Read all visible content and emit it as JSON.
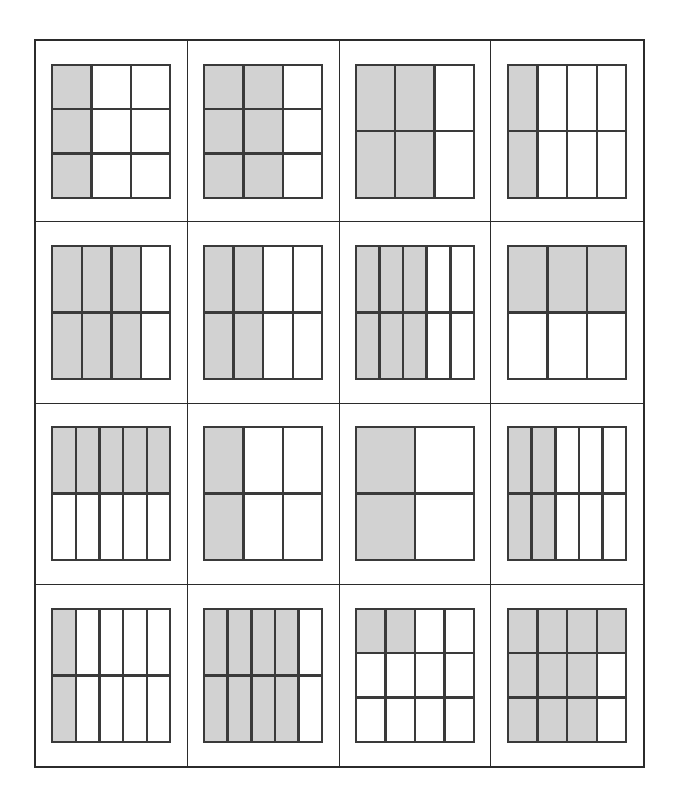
{
  "worksheet": {
    "layout": {
      "panel_rows": 4,
      "panel_cols": 4,
      "panel_count": 16
    },
    "colors": {
      "shaded": "#d2d2d2",
      "unshaded": "#ffffff",
      "grid_line": "#3a3a3a",
      "frame_line": "#2b2b2b",
      "background": "#ffffff"
    },
    "panels": [
      {
        "index": 1,
        "name": "fraction-model-1",
        "cols": 3,
        "rows": 3,
        "total_parts": 9,
        "shaded_parts": 3,
        "fraction": "3/9",
        "simplified": "1/3",
        "shading_pattern": "left-columns",
        "shaded_columns": 1,
        "cells": [
          [
            1,
            0,
            0
          ],
          [
            1,
            0,
            0
          ],
          [
            1,
            0,
            0
          ]
        ]
      },
      {
        "index": 2,
        "name": "fraction-model-2",
        "cols": 3,
        "rows": 3,
        "total_parts": 9,
        "shaded_parts": 6,
        "fraction": "6/9",
        "simplified": "2/3",
        "shading_pattern": "left-columns",
        "shaded_columns": 2,
        "cells": [
          [
            1,
            1,
            0
          ],
          [
            1,
            1,
            0
          ],
          [
            1,
            1,
            0
          ]
        ]
      },
      {
        "index": 3,
        "name": "fraction-model-3",
        "cols": 3,
        "rows": 2,
        "total_parts": 6,
        "shaded_parts": 4,
        "fraction": "4/6",
        "simplified": "2/3",
        "shading_pattern": "left-columns",
        "shaded_columns": 2,
        "cells": [
          [
            1,
            1,
            0
          ],
          [
            1,
            1,
            0
          ]
        ]
      },
      {
        "index": 4,
        "name": "fraction-model-4",
        "cols": 4,
        "rows": 2,
        "total_parts": 8,
        "shaded_parts": 2,
        "fraction": "2/8",
        "simplified": "1/4",
        "shading_pattern": "left-columns",
        "shaded_columns": 1,
        "cells": [
          [
            1,
            0,
            0,
            0
          ],
          [
            1,
            0,
            0,
            0
          ]
        ]
      },
      {
        "index": 5,
        "name": "fraction-model-5",
        "cols": 4,
        "rows": 2,
        "total_parts": 8,
        "shaded_parts": 6,
        "fraction": "6/8",
        "simplified": "3/4",
        "shading_pattern": "left-columns",
        "shaded_columns": 3,
        "cells": [
          [
            1,
            1,
            1,
            0
          ],
          [
            1,
            1,
            1,
            0
          ]
        ]
      },
      {
        "index": 6,
        "name": "fraction-model-6",
        "cols": 4,
        "rows": 2,
        "total_parts": 8,
        "shaded_parts": 4,
        "fraction": "4/8",
        "simplified": "1/2",
        "shading_pattern": "left-columns",
        "shaded_columns": 2,
        "cells": [
          [
            1,
            1,
            0,
            0
          ],
          [
            1,
            1,
            0,
            0
          ]
        ]
      },
      {
        "index": 7,
        "name": "fraction-model-7",
        "cols": 5,
        "rows": 2,
        "total_parts": 10,
        "shaded_parts": 6,
        "fraction": "6/10",
        "simplified": "3/5",
        "shading_pattern": "left-columns",
        "shaded_columns": 3,
        "cells": [
          [
            1,
            1,
            1,
            0,
            0
          ],
          [
            1,
            1,
            1,
            0,
            0
          ]
        ]
      },
      {
        "index": 8,
        "name": "fraction-model-8",
        "cols": 3,
        "rows": 2,
        "total_parts": 6,
        "shaded_parts": 3,
        "fraction": "3/6",
        "simplified": "1/2",
        "shading_pattern": "top-rows",
        "shaded_rows": 1,
        "cells": [
          [
            1,
            1,
            1
          ],
          [
            0,
            0,
            0
          ]
        ]
      },
      {
        "index": 9,
        "name": "fraction-model-9",
        "cols": 5,
        "rows": 2,
        "total_parts": 10,
        "shaded_parts": 5,
        "fraction": "5/10",
        "simplified": "1/2",
        "shading_pattern": "top-rows",
        "shaded_rows": 1,
        "cells": [
          [
            1,
            1,
            1,
            1,
            1
          ],
          [
            0,
            0,
            0,
            0,
            0
          ]
        ]
      },
      {
        "index": 10,
        "name": "fraction-model-10",
        "cols": 3,
        "rows": 2,
        "total_parts": 6,
        "shaded_parts": 2,
        "fraction": "2/6",
        "simplified": "1/3",
        "shading_pattern": "left-columns",
        "shaded_columns": 1,
        "cells": [
          [
            1,
            0,
            0
          ],
          [
            1,
            0,
            0
          ]
        ]
      },
      {
        "index": 11,
        "name": "fraction-model-11",
        "cols": 2,
        "rows": 2,
        "total_parts": 4,
        "shaded_parts": 2,
        "fraction": "2/4",
        "simplified": "1/2",
        "shading_pattern": "left-columns",
        "shaded_columns": 1,
        "cells": [
          [
            1,
            0
          ],
          [
            1,
            0
          ]
        ]
      },
      {
        "index": 12,
        "name": "fraction-model-12",
        "cols": 5,
        "rows": 2,
        "total_parts": 10,
        "shaded_parts": 4,
        "fraction": "4/10",
        "simplified": "2/5",
        "shading_pattern": "left-columns",
        "shaded_columns": 2,
        "cells": [
          [
            1,
            1,
            0,
            0,
            0
          ],
          [
            1,
            1,
            0,
            0,
            0
          ]
        ]
      },
      {
        "index": 13,
        "name": "fraction-model-13",
        "cols": 5,
        "rows": 2,
        "total_parts": 10,
        "shaded_parts": 2,
        "fraction": "2/10",
        "simplified": "1/5",
        "shading_pattern": "left-columns",
        "shaded_columns": 1,
        "cells": [
          [
            1,
            0,
            0,
            0,
            0
          ],
          [
            1,
            0,
            0,
            0,
            0
          ]
        ]
      },
      {
        "index": 14,
        "name": "fraction-model-14",
        "cols": 5,
        "rows": 2,
        "total_parts": 10,
        "shaded_parts": 8,
        "fraction": "8/10",
        "simplified": "4/5",
        "shading_pattern": "left-columns",
        "shaded_columns": 4,
        "cells": [
          [
            1,
            1,
            1,
            1,
            0
          ],
          [
            1,
            1,
            1,
            1,
            0
          ]
        ]
      },
      {
        "index": 15,
        "name": "fraction-model-15",
        "cols": 4,
        "rows": 3,
        "total_parts": 12,
        "shaded_parts": 2,
        "fraction": "2/12",
        "simplified": "1/6",
        "shading_pattern": "partial-top-left",
        "cells": [
          [
            1,
            1,
            0,
            0
          ],
          [
            0,
            0,
            0,
            0
          ],
          [
            0,
            0,
            0,
            0
          ]
        ]
      },
      {
        "index": 16,
        "name": "fraction-model-16",
        "cols": 4,
        "rows": 3,
        "total_parts": 12,
        "shaded_parts": 10,
        "fraction": "10/12",
        "simplified": "5/6",
        "shading_pattern": "partial-l-shape",
        "cells": [
          [
            1,
            1,
            1,
            1
          ],
          [
            1,
            1,
            1,
            0
          ],
          [
            1,
            1,
            1,
            0
          ]
        ]
      }
    ]
  }
}
